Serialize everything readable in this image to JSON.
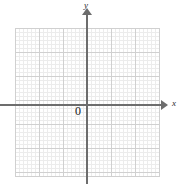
{
  "figure": {
    "kind": "blank-cartesian-coordinate-plane",
    "background_color": "#ffffff"
  },
  "axes": {
    "x": {
      "label": "x",
      "arrow": "arrow-right-icon",
      "color": "#6d6d6d"
    },
    "y": {
      "label": "y",
      "arrow": "arrow-up-icon",
      "color": "#6d6d6d"
    },
    "origin": {
      "label": "0",
      "color": "#1a1a1a"
    }
  },
  "grid": {
    "major_line_color": "#d8d8d8",
    "minor_line_color": "#ececec",
    "border_color": "#d0d0d0",
    "major_cells_x": 12,
    "major_cells_y": 12,
    "minor_per_major": 3
  },
  "chart_data": {
    "type": "scatter",
    "title": "",
    "subtitle": "",
    "xlabel": "x",
    "ylabel": "y",
    "origin_label": "0",
    "grid": true,
    "legend": null,
    "xlim": [
      -6,
      6
    ],
    "ylim": [
      -6,
      6
    ],
    "xticks": [
      -6,
      -5,
      -4,
      -3,
      -2,
      -1,
      0,
      1,
      2,
      3,
      4,
      5,
      6
    ],
    "yticks": [
      -6,
      -5,
      -4,
      -3,
      -2,
      -1,
      0,
      1,
      2,
      3,
      4,
      5,
      6
    ],
    "xticklabels": [
      "",
      "",
      "",
      "",
      "",
      "",
      "0",
      "",
      "",
      "",
      "",
      "",
      ""
    ],
    "yticklabels": [
      "",
      "",
      "",
      "",
      "",
      "",
      "",
      "",
      "",
      "",
      "",
      "",
      ""
    ],
    "series": [],
    "annotations": []
  }
}
